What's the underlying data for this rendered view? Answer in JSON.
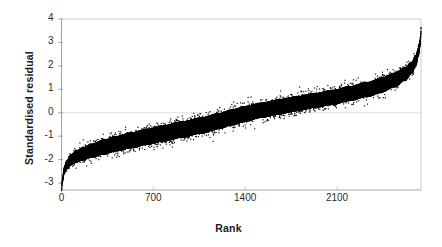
{
  "chart_data": {
    "type": "scatter",
    "title": "",
    "subtitle": "",
    "xlabel": "Rank",
    "ylabel": "Standardised residual",
    "xlim": [
      0,
      2740
    ],
    "ylim": [
      -3.5,
      4
    ],
    "xticks": [
      0,
      700,
      1400,
      2100
    ],
    "xtick_labels": [
      "0",
      "700",
      "1400",
      "2100"
    ],
    "yticks": [
      -3,
      -2,
      -1,
      0,
      1,
      2,
      3,
      4
    ],
    "ytick_labels": [
      "-3",
      "-2",
      "-1",
      "0",
      "1",
      "2",
      "3",
      "4"
    ],
    "grid": "horizontal-zero-line-only",
    "legend": "none",
    "marker_color": "#000000",
    "axis_color": "#9a9a9a",
    "background_color": "#ffffff",
    "n_points": 2740,
    "series": [
      {
        "name": "Standardised residual",
        "color": "#000000",
        "curve_points": [
          {
            "rank": 0,
            "residual": -3.3,
            "spread": 0.1
          },
          {
            "rank": 8,
            "residual": -2.85,
            "spread": 0.18
          },
          {
            "rank": 20,
            "residual": -2.48,
            "spread": 0.26
          },
          {
            "rank": 40,
            "residual": -2.22,
            "spread": 0.34
          },
          {
            "rank": 70,
            "residual": -2.02,
            "spread": 0.42
          },
          {
            "rank": 110,
            "residual": -1.88,
            "spread": 0.48
          },
          {
            "rank": 160,
            "residual": -1.76,
            "spread": 0.52
          },
          {
            "rank": 230,
            "residual": -1.62,
            "spread": 0.56
          },
          {
            "rank": 320,
            "residual": -1.47,
            "spread": 0.6
          },
          {
            "rank": 420,
            "residual": -1.32,
            "spread": 0.62
          },
          {
            "rank": 530,
            "residual": -1.18,
            "spread": 0.64
          },
          {
            "rank": 650,
            "residual": -1.03,
            "spread": 0.65
          },
          {
            "rank": 780,
            "residual": -0.88,
            "spread": 0.66
          },
          {
            "rank": 920,
            "residual": -0.72,
            "spread": 0.66
          },
          {
            "rank": 1060,
            "residual": -0.55,
            "spread": 0.66
          },
          {
            "rank": 1200,
            "residual": -0.36,
            "spread": 0.65
          },
          {
            "rank": 1300,
            "residual": -0.2,
            "spread": 0.64
          },
          {
            "rank": 1400,
            "residual": -0.05,
            "spread": 0.63
          },
          {
            "rank": 1520,
            "residual": 0.1,
            "spread": 0.62
          },
          {
            "rank": 1650,
            "residual": 0.24,
            "spread": 0.61
          },
          {
            "rank": 1790,
            "residual": 0.38,
            "spread": 0.6
          },
          {
            "rank": 1930,
            "residual": 0.52,
            "spread": 0.6
          },
          {
            "rank": 2070,
            "residual": 0.66,
            "spread": 0.6
          },
          {
            "rank": 2200,
            "residual": 0.82,
            "spread": 0.6
          },
          {
            "rank": 2330,
            "residual": 0.99,
            "spread": 0.6
          },
          {
            "rank": 2440,
            "residual": 1.18,
            "spread": 0.6
          },
          {
            "rank": 2540,
            "residual": 1.4,
            "spread": 0.58
          },
          {
            "rank": 2620,
            "residual": 1.66,
            "spread": 0.54
          },
          {
            "rank": 2670,
            "residual": 1.92,
            "spread": 0.48
          },
          {
            "rank": 2700,
            "residual": 2.22,
            "spread": 0.42
          },
          {
            "rank": 2720,
            "residual": 2.58,
            "spread": 0.34
          },
          {
            "rank": 2732,
            "residual": 2.95,
            "spread": 0.26
          },
          {
            "rank": 2738,
            "residual": 3.32,
            "spread": 0.16
          },
          {
            "rank": 2740,
            "residual": 3.62,
            "spread": 0.06
          }
        ]
      }
    ]
  }
}
